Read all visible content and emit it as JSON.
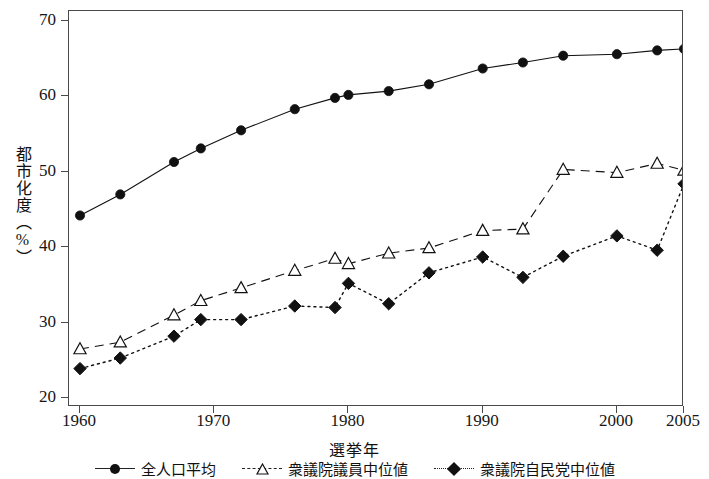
{
  "chart_data": {
    "type": "line",
    "title": "",
    "xlabel": "選挙年",
    "ylabel": "都市化度（%）",
    "xlim": [
      1958,
      2007
    ],
    "ylim": [
      20,
      72
    ],
    "grid": false,
    "legend_position": "bottom",
    "yticks": [
      20,
      30,
      40,
      50,
      60,
      70
    ],
    "xticks": [
      1960,
      1970,
      1980,
      1990,
      2000,
      2005
    ],
    "x": [
      1960,
      1963,
      1967,
      1969,
      1972,
      1976,
      1979,
      1980,
      1983,
      1986,
      1990,
      1993,
      1996,
      2000,
      2003,
      2005
    ],
    "series": [
      {
        "name": "全人口平均",
        "marker": "filled-circle",
        "linestyle": "solid",
        "color": "#111111",
        "values": [
          44.2,
          47.0,
          51.3,
          53.1,
          55.5,
          58.3,
          59.8,
          60.2,
          60.7,
          61.6,
          63.7,
          64.5,
          65.4,
          65.6,
          66.1,
          66.3
        ]
      },
      {
        "name": "衆議院議員中位値",
        "marker": "open-triangle",
        "linestyle": "dashed",
        "color": "#111111",
        "values": [
          26.5,
          27.4,
          31.0,
          32.9,
          34.6,
          36.9,
          38.5,
          37.8,
          39.2,
          39.9,
          42.2,
          42.4,
          50.3,
          49.9,
          51.1,
          50.2
        ]
      },
      {
        "name": "衆議院自民党中位値",
        "marker": "filled-diamond",
        "linestyle": "dotted",
        "color": "#111111",
        "values": [
          23.9,
          25.3,
          28.2,
          30.4,
          30.4,
          32.2,
          32.0,
          35.2,
          32.5,
          36.6,
          38.7,
          36.0,
          38.8,
          41.5,
          39.6,
          48.4
        ]
      }
    ]
  },
  "axes": {
    "ylabel": "都市化度（%）",
    "xlabel": "選挙年"
  }
}
